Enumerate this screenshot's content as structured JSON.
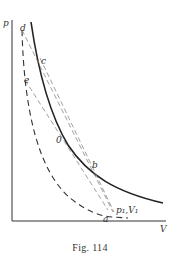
{
  "figure": {
    "caption": "Fig. 114",
    "axes": {
      "y_label": "p",
      "x_label": "V"
    },
    "points": {
      "d": "d",
      "c": "c",
      "e": "e",
      "o": "0",
      "b": "b",
      "a": "a",
      "p1v1": "p₁,V₁"
    },
    "curves": [
      {
        "name": "isotherm",
        "style": "solid"
      },
      {
        "name": "adiabat",
        "style": "dashed"
      },
      {
        "name": "line-d-to-p1",
        "style": "dashed"
      },
      {
        "name": "line-c-to-p1",
        "style": "dashed"
      },
      {
        "name": "line-e-to-b",
        "style": "dashed"
      }
    ],
    "colors": {
      "ink": "#222222",
      "dashed": "#666666"
    }
  }
}
